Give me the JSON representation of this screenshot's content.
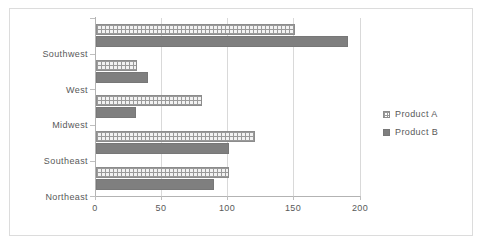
{
  "chart_data": {
    "type": "bar",
    "orientation": "horizontal",
    "title": "",
    "subtitle": "",
    "xlabel": "",
    "ylabel": "",
    "categories": [
      "Northeast",
      "Southeast",
      "Midwest",
      "West",
      "Southwest"
    ],
    "series": [
      {
        "name": "Product A",
        "values": [
          100,
          120,
          80,
          31,
          150
        ],
        "color": "#f2f2f2",
        "pattern": "grid-hatch"
      },
      {
        "name": "Product B",
        "values": [
          89,
          100,
          30,
          39,
          190
        ],
        "color": "#7f7f7f",
        "pattern": "solid"
      }
    ],
    "xlim": [
      0,
      200
    ],
    "xticks": [
      0,
      50,
      100,
      150,
      200
    ],
    "xtick_labels": [
      "0",
      "50",
      "100",
      "150",
      "200"
    ],
    "grid": true,
    "grid_axis": "x",
    "legend": {
      "position": "right",
      "entries": [
        {
          "label": "Product A",
          "marker": "grid-hatch-square"
        },
        {
          "label": "Product B",
          "marker": "solid-gray-square"
        }
      ]
    },
    "plot_background": "#ffffff",
    "border_color": "#dcdcdc",
    "axis_color": "#b3b3b3",
    "gridline_color": "#d9d9d9",
    "text_color": "#595959"
  }
}
